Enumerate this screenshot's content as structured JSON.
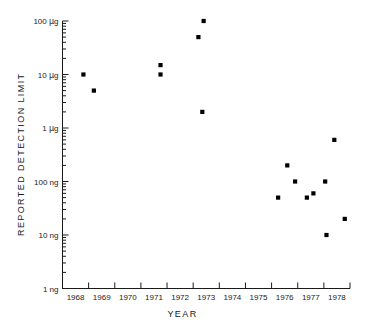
{
  "chart_data": {
    "type": "scatter",
    "title": "",
    "xlabel": "YEAR",
    "ylabel": "REPORTED DETECTION LIMIT",
    "grid": false,
    "legend": "none",
    "yscale": "log",
    "xlim": [
      1967.5,
      1978.5
    ],
    "ylim_ng": [
      1,
      100000
    ],
    "y_unit_note": "values expressed in nanograms; axis labelled in ng and µg",
    "x_ticks": [
      1967.5,
      1968.5,
      1969.5,
      1970.5,
      1971.5,
      1972.5,
      1973.5,
      1974.5,
      1975.5,
      1976.5,
      1977.5,
      1978.5
    ],
    "x_tick_labels": [
      "1968",
      "1969",
      "1970",
      "1971",
      "1972",
      "1973",
      "1974",
      "1975",
      "1976",
      "1977",
      "1978"
    ],
    "y_ticks_ng": [
      1,
      10,
      100,
      1000,
      10000,
      100000
    ],
    "y_tick_labels": [
      "1 ng",
      "10 ng",
      "100 ng",
      "1 µg",
      "10 µg",
      "100 µg"
    ],
    "y_minor_ticks": true,
    "marker": "filled-square",
    "marker_color": "#000000",
    "points": [
      {
        "x": 1968.3,
        "y_ng": 10000,
        "label": "10 µg"
      },
      {
        "x": 1968.7,
        "y_ng": 5000,
        "label": "5 µg"
      },
      {
        "x": 1971.25,
        "y_ng": 15000,
        "label": "15 µg"
      },
      {
        "x": 1971.25,
        "y_ng": 10000,
        "label": "10 µg"
      },
      {
        "x": 1972.7,
        "y_ng": 50000,
        "label": "50 µg"
      },
      {
        "x": 1972.9,
        "y_ng": 100000,
        "label": "100 µg"
      },
      {
        "x": 1972.85,
        "y_ng": 2000,
        "label": "2 µg"
      },
      {
        "x": 1975.75,
        "y_ng": 50,
        "label": "50 ng"
      },
      {
        "x": 1976.1,
        "y_ng": 200,
        "label": "200 ng"
      },
      {
        "x": 1976.4,
        "y_ng": 100,
        "label": "100 ng"
      },
      {
        "x": 1976.85,
        "y_ng": 50,
        "label": "50 ng"
      },
      {
        "x": 1977.1,
        "y_ng": 60,
        "label": "60 ng"
      },
      {
        "x": 1977.55,
        "y_ng": 100,
        "label": "100 ng"
      },
      {
        "x": 1977.6,
        "y_ng": 10,
        "label": "10 ng"
      },
      {
        "x": 1977.9,
        "y_ng": 600,
        "label": "600 ng"
      },
      {
        "x": 1978.3,
        "y_ng": 20,
        "label": "20 ng"
      }
    ]
  }
}
